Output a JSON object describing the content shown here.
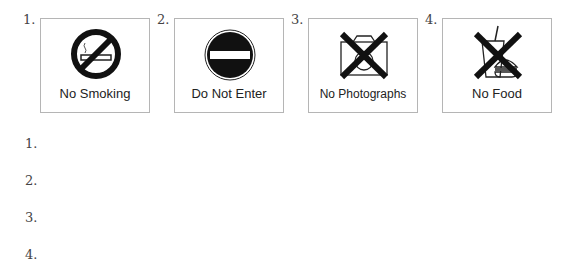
{
  "signs": [
    {
      "number": "1.",
      "label": "No Smoking",
      "icon": "no-smoking-icon"
    },
    {
      "number": "2.",
      "label": "Do Not Enter",
      "icon": "do-not-enter-icon"
    },
    {
      "number": "3.",
      "label": "No Photographs",
      "icon": "no-photographs-icon"
    },
    {
      "number": "4.",
      "label": "No Food",
      "icon": "no-food-icon"
    }
  ],
  "answers": [
    {
      "number": "1."
    },
    {
      "number": "2."
    },
    {
      "number": "3."
    },
    {
      "number": "4."
    }
  ]
}
